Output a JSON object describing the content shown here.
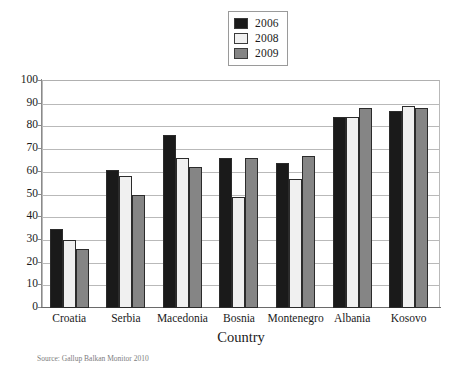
{
  "legend": {
    "position": "top-center",
    "entries": [
      {
        "label": "2006",
        "color": "#1a1a1a"
      },
      {
        "label": "2008",
        "color": "#f0f0f0"
      },
      {
        "label": "2009",
        "color": "#858585"
      }
    ]
  },
  "axes": {
    "x_title": "Country",
    "y_title": "",
    "y_ticks": [
      "0",
      "10",
      "20",
      "30",
      "40",
      "50",
      "60",
      "70",
      "80",
      "90",
      "100"
    ]
  },
  "source_note": "Source: Gallup Balkan Monitor 2010",
  "chart_data": {
    "type": "bar",
    "title": "",
    "subtitle": "",
    "xlabel": "Country",
    "ylabel": "",
    "ylim": [
      0,
      100
    ],
    "ytick_step": 10,
    "grid": true,
    "legend_position": "top-center",
    "categories": [
      "Croatia",
      "Serbia",
      "Macedonia",
      "Bosnia",
      "Montenegro",
      "Albania",
      "Kosovo"
    ],
    "series": [
      {
        "name": "2006",
        "color": "#1a1a1a",
        "values": [
          35,
          61,
          76,
          66,
          64,
          84,
          87
        ]
      },
      {
        "name": "2008",
        "color": "#f0f0f0",
        "values": [
          30,
          58,
          66,
          49,
          57,
          84,
          89
        ]
      },
      {
        "name": "2009",
        "color": "#858585",
        "values": [
          26,
          50,
          62,
          66,
          67,
          88,
          88
        ]
      }
    ]
  }
}
